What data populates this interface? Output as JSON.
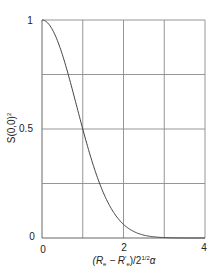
{
  "chart_data": {
    "type": "line",
    "title": "",
    "xlabel": "(R_e − R'_e)/2^{1/2}α",
    "ylabel": "S(0,0)^2",
    "xlim": [
      0,
      4
    ],
    "ylim": [
      0,
      1
    ],
    "x_ticks": [
      "0",
      "2",
      "4"
    ],
    "y_ticks": [
      "0",
      "0.5",
      "1"
    ],
    "grid": true,
    "grid_x": [
      0,
      1,
      2,
      3,
      4
    ],
    "grid_y": [
      0,
      0.25,
      0.5,
      0.75,
      1
    ],
    "legend": null,
    "series": [
      {
        "name": "S(0,0)^2",
        "x": [
          0,
          0.25,
          0.5,
          0.75,
          1.0,
          1.25,
          1.5,
          1.75,
          2.0,
          2.5,
          3.0,
          3.5,
          4.0
        ],
        "values": [
          1.0,
          0.96,
          0.84,
          0.68,
          0.5,
          0.34,
          0.21,
          0.12,
          0.06,
          0.013,
          0.002,
          0.0002,
          0.0
        ]
      }
    ]
  },
  "labels": {
    "y_tick_0": "0",
    "y_tick_05": "0.5",
    "y_tick_1": "1",
    "x_tick_0": "0",
    "x_tick_2": "2",
    "x_tick_4": "4",
    "ylabel_main": "S(0,0)",
    "ylabel_sup": "2",
    "xlabel_open": "(R",
    "xlabel_sub1": "e",
    "xlabel_mid": " − R",
    "xlabel_prime": "′",
    "xlabel_sub2": "e",
    "xlabel_close": ")/2",
    "xlabel_sup": "1/2",
    "xlabel_alpha": "α"
  },
  "colors": {
    "grid": "#8a8a8a",
    "curve": "#444444",
    "text": "#222222"
  }
}
